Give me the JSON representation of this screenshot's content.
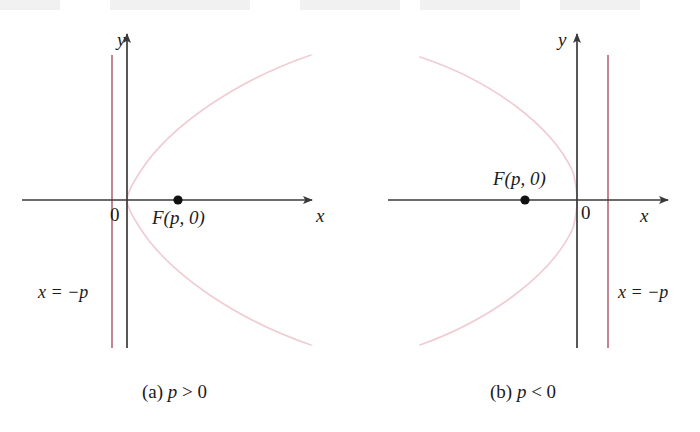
{
  "figure": {
    "colors": {
      "axis": "#3a3a3a",
      "curve": "#f0cdd4",
      "directrix": "#b9707f",
      "point": "#111111",
      "text": "#1b1b1b",
      "background": "#ffffff"
    },
    "panels": [
      {
        "id": "panel-a",
        "caption": "(a) p > 0",
        "caption_prefix": "(a)",
        "caption_var": "p",
        "caption_relation": "> 0",
        "y_axis_label": "y",
        "x_axis_label": "x",
        "origin_label": "0",
        "focus_label": "F(p, 0)",
        "directrix_label": "x = −p",
        "opens": "right",
        "focus_sign": "positive"
      },
      {
        "id": "panel-b",
        "caption": "(b) p < 0",
        "caption_prefix": "(b)",
        "caption_var": "p",
        "caption_relation": "< 0",
        "y_axis_label": "y",
        "x_axis_label": "x",
        "origin_label": "0",
        "focus_label": "F(p, 0)",
        "directrix_label": "x = −p",
        "opens": "left",
        "focus_sign": "negative"
      }
    ]
  },
  "chart_data": {
    "type": "line",
    "xlabel": "x",
    "ylabel": "y",
    "grid": false,
    "legend": null,
    "series": [
      {
        "name": "parabola (a) p > 0, opens right",
        "vertex": [
          0,
          0
        ],
        "focus": [
          1,
          0
        ],
        "directrix_x": -1,
        "equation": "y^2 = 4px with p > 0"
      },
      {
        "name": "parabola (b) p < 0, opens left",
        "vertex": [
          0,
          0
        ],
        "focus": [
          -1,
          0
        ],
        "directrix_x": 1,
        "equation": "y^2 = 4px with p < 0"
      }
    ],
    "annotations": [
      "F(p, 0)",
      "x = −p",
      "0",
      "(a) p > 0",
      "(b) p < 0"
    ]
  }
}
